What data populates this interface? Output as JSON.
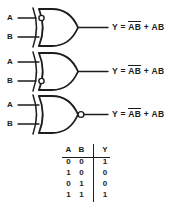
{
  "diagram": {
    "line_color": "#1d1d1d",
    "background_color": "#ffffff",
    "gates": [
      {
        "id": "gate-1",
        "type": "xor-gate-with-inverted-a-input",
        "shape": "xor",
        "input_a_label": "A",
        "input_b_label": "B",
        "bubble": "input-a",
        "output_label": "Y"
      },
      {
        "id": "gate-2",
        "type": "xor-gate-with-inverted-b-input",
        "shape": "xor",
        "input_a_label": "A",
        "input_b_label": "B",
        "bubble": "input-b",
        "output_label": "Y"
      },
      {
        "id": "gate-3",
        "type": "xnor-gate",
        "shape": "xor",
        "input_a_label": "A",
        "input_b_label": "B",
        "bubble": "output",
        "output_label": "Y"
      }
    ],
    "equations": [
      {
        "id": "equation-1",
        "lhs": "Y",
        "eq": "=",
        "term1_a": "A",
        "term1_b": "B",
        "term1_bar": "joint",
        "plus": "+",
        "term2_a": "A",
        "term2_b": "B",
        "text": "Y = A̅B̅ + AB"
      },
      {
        "id": "equation-2",
        "lhs": "Y",
        "eq": "=",
        "term1_a": "A",
        "term1_b": "B",
        "term1_bar": "separate",
        "plus": "+",
        "term2_a": "A",
        "term2_b": "B",
        "text": "Y = A̅B̅ + AB"
      },
      {
        "id": "equation-3",
        "lhs": "Y",
        "eq": "=",
        "term1_a": "A",
        "term1_b": "B",
        "term1_bar": "joint",
        "plus": "+",
        "term2_a": "A",
        "term2_b": "B",
        "text": "Y = A̅B̅ + AB"
      }
    ]
  },
  "truth_table": {
    "headers": {
      "a": "A",
      "b": "B",
      "y": "Y"
    },
    "rows": [
      {
        "a": "0",
        "b": "0",
        "y": "1"
      },
      {
        "a": "1",
        "b": "0",
        "y": "0"
      },
      {
        "a": "0",
        "b": "1",
        "y": "0"
      },
      {
        "a": "1",
        "b": "1",
        "y": "1"
      }
    ]
  }
}
